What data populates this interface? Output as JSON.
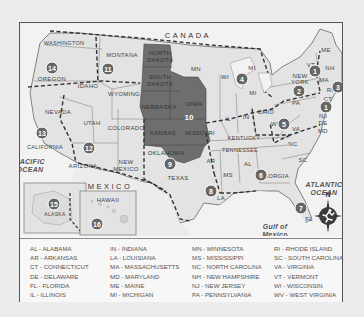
{
  "map": {
    "country_labels": {
      "canada": "CANADA",
      "mexico": "MEXICO"
    },
    "water_labels": {
      "pacific": "PACIFIC\nOCEAN",
      "atlantic": "ATLANTIC\nOCEAN",
      "gulf": "Gulf of\nMexico"
    },
    "compass": {
      "label": "N"
    },
    "highlight_color": "#6e6e6e",
    "land_color": "#e6e6e6",
    "state_labels": [
      {
        "id": "washington",
        "text": "WASHINGTON",
        "x": 44,
        "y": 20
      },
      {
        "id": "oregon",
        "text": "OREGON",
        "x": 32,
        "y": 56
      },
      {
        "id": "idaho",
        "text": "IDAHO",
        "x": 68,
        "y": 63
      },
      {
        "id": "montana",
        "text": "MONTANA",
        "x": 102,
        "y": 32
      },
      {
        "id": "wyoming",
        "text": "WYOMING",
        "x": 104,
        "y": 71
      },
      {
        "id": "nevada",
        "text": "NEVADA",
        "x": 38,
        "y": 89
      },
      {
        "id": "utah",
        "text": "UTAH",
        "x": 72,
        "y": 100
      },
      {
        "id": "colorado",
        "text": "COLORADO",
        "x": 106,
        "y": 105
      },
      {
        "id": "california",
        "text": "CALIFORNIA",
        "x": 25,
        "y": 124
      },
      {
        "id": "arizona",
        "text": "ARIZONA",
        "x": 63,
        "y": 143
      },
      {
        "id": "new-mexico",
        "text": "NEW\nMEXICO",
        "x": 106,
        "y": 143
      },
      {
        "id": "texas",
        "text": "TEXAS",
        "x": 150,
        "y": 155
      },
      {
        "id": "north-dakota",
        "text": "NORTH\nDAKOTA",
        "x": 144,
        "y": 36
      },
      {
        "id": "south-dakota",
        "text": "SOUTH\nDAKOTA",
        "x": 144,
        "y": 60
      },
      {
        "id": "nebraska",
        "text": "NEBRASKA",
        "x": 139,
        "y": 84
      },
      {
        "id": "kansas",
        "text": "KANSAS",
        "x": 143,
        "y": 110
      },
      {
        "id": "oklahoma",
        "text": "OKLAHOMA",
        "x": 146,
        "y": 130
      },
      {
        "id": "iowa",
        "text": "IOWA",
        "x": 182,
        "y": 81
      },
      {
        "id": "missouri",
        "text": "MISSOURI",
        "x": 191,
        "y": 107
      },
      {
        "id": "mn",
        "text": "MN",
        "x": 176,
        "y": 46
      },
      {
        "id": "wi",
        "text": "WI",
        "x": 205,
        "y": 54
      },
      {
        "id": "mi-upper",
        "text": "MI",
        "x": 232,
        "y": 45
      },
      {
        "id": "mi-lower",
        "text": "MI",
        "x": 233,
        "y": 70
      },
      {
        "id": "il",
        "text": "IL",
        "x": 208,
        "y": 96
      },
      {
        "id": "in",
        "text": "IN",
        "x": 226,
        "y": 94
      },
      {
        "id": "ohio",
        "text": "OHIO",
        "x": 246,
        "y": 89
      },
      {
        "id": "kentucky",
        "text": "KENTUCKY",
        "x": 228,
        "y": 115
      },
      {
        "id": "wv",
        "text": "WV",
        "x": 258,
        "y": 101
      },
      {
        "id": "va",
        "text": "VA",
        "x": 273,
        "y": 106
      },
      {
        "id": "tennessee",
        "text": "TENNESSEE",
        "x": 222,
        "y": 127
      },
      {
        "id": "nc",
        "text": "NC",
        "x": 273,
        "y": 121
      },
      {
        "id": "sc",
        "text": "SC",
        "x": 283,
        "y": 137
      },
      {
        "id": "ar",
        "text": "AR",
        "x": 195,
        "y": 138
      },
      {
        "id": "ms",
        "text": "MS",
        "x": 206,
        "y": 152
      },
      {
        "id": "al",
        "text": "AL",
        "x": 226,
        "y": 142
      },
      {
        "id": "georgia",
        "text": "GEORGIA",
        "x": 251,
        "y": 154
      },
      {
        "id": "la",
        "text": "LA",
        "x": 201,
        "y": 175
      },
      {
        "id": "fl",
        "text": "FL",
        "x": 287,
        "y": 195
      },
      {
        "id": "pa",
        "text": "PA",
        "x": 275,
        "y": 79
      },
      {
        "id": "new-york",
        "text": "NEW\nYORK",
        "x": 281,
        "y": 57
      },
      {
        "id": "vt",
        "text": "VT",
        "x": 293,
        "y": 41
      },
      {
        "id": "nh",
        "text": "NH",
        "x": 309,
        "y": 45
      },
      {
        "id": "me",
        "text": "ME",
        "x": 307,
        "y": 27
      },
      {
        "id": "ma",
        "text": "MA",
        "x": 304,
        "y": 57
      },
      {
        "id": "ri",
        "text": "RI",
        "x": 309,
        "y": 67
      },
      {
        "id": "ct",
        "text": "CT",
        "x": 306,
        "y": 76
      },
      {
        "id": "nj",
        "text": "NJ",
        "x": 302,
        "y": 93
      },
      {
        "id": "de",
        "text": "DE",
        "x": 302,
        "y": 100
      },
      {
        "id": "md",
        "text": "MD",
        "x": 302,
        "y": 108
      },
      {
        "id": "alaska",
        "text": "ALASKA",
        "x": 35,
        "y": 190
      },
      {
        "id": "hawaii",
        "text": "HAWAII",
        "x": 86,
        "y": 185
      }
    ],
    "region_numbers": [
      {
        "n": "1",
        "x": 295,
        "y": 48
      },
      {
        "n": "1",
        "x": 306,
        "y": 84
      },
      {
        "n": "2",
        "x": 279,
        "y": 68
      },
      {
        "n": "3",
        "x": 318,
        "y": 65
      },
      {
        "n": "4",
        "x": 222,
        "y": 56
      },
      {
        "n": "5",
        "x": 264,
        "y": 100
      },
      {
        "n": "6",
        "x": 230,
        "y": 152
      },
      {
        "n": "7",
        "x": 283,
        "y": 184
      },
      {
        "n": "8",
        "x": 191,
        "y": 168
      },
      {
        "n": "9",
        "x": 150,
        "y": 141
      },
      {
        "n": "10",
        "x": 171,
        "y": 93
      },
      {
        "n": "11",
        "x": 88,
        "y": 46
      },
      {
        "n": "12",
        "x": 69,
        "y": 125
      },
      {
        "n": "13",
        "x": 22,
        "y": 110
      },
      {
        "n": "14",
        "x": 32,
        "y": 45
      },
      {
        "n": "15",
        "x": 34,
        "y": 180
      },
      {
        "n": "16",
        "x": 79,
        "y": 204
      }
    ]
  },
  "legend": {
    "columns": [
      [
        "AL - ALABAMA",
        "AR - ARKANSAS",
        "CT - CONNECTICUT",
        "DE - DELAWARE",
        "FL - FLORIDA",
        "IL - ILLINOIS"
      ],
      [
        "IN - INDIANA",
        "LA - LOUISIANA",
        "MA - MASSACHUSETTS",
        "MD - MARYLAND",
        "ME - MAINE",
        "MI - MICHIGAN"
      ],
      [
        "MN - MINNESOTA",
        "MS - MISSISSIPPI",
        "NC - NORTH CAROLINA",
        "NH - NEW HAMPSHIRE",
        "NJ - NEW JERSEY",
        "PA - PENNSYLVANIA"
      ],
      [
        "RI - RHODE ISLAND",
        "SC - SOUTH CAROLINA",
        "VA - VIRGINIA",
        "VT - VERMONT",
        "WI - WISCONSIN",
        "WV - WEST VIRGINIA"
      ]
    ]
  }
}
